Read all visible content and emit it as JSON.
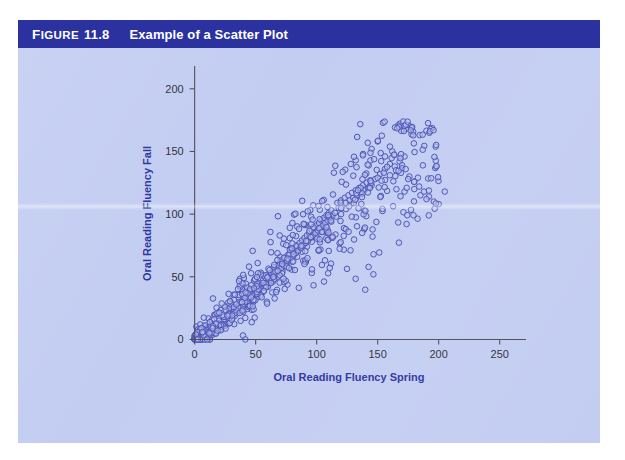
{
  "figure": {
    "label_word": "Figure",
    "label_word_first": "F",
    "label_word_rest": "IGURE",
    "number": "11.8",
    "title": "Example of a Scatter Plot"
  },
  "colors": {
    "header_bar": "#2b32a0",
    "panel_background": "#c3cdf2",
    "axis_title": "#2b32a0",
    "point_stroke": "#4a52b8",
    "point_fill": "#b9c2ea",
    "axis_line": "#4d4d57",
    "tick_label": "#2e2e38",
    "page_background": "#ffffff"
  },
  "chart_data": {
    "type": "scatter",
    "title": "Example of a Scatter Plot",
    "xlabel": "Oral Reading Fluency Spring",
    "ylabel": "Oral Reading Fluency Fall",
    "xlim": [
      -12,
      265
    ],
    "ylim": [
      -14,
      215
    ],
    "xticks": [
      0,
      50,
      100,
      150,
      200,
      250
    ],
    "yticks": [
      0,
      50,
      100,
      150,
      200
    ],
    "xtick_labels": [
      "0",
      "50",
      "100",
      "150",
      "200",
      "250"
    ],
    "ytick_labels": [
      "0",
      "50",
      "100",
      "150",
      "200"
    ],
    "grid": false,
    "legend": null,
    "marker": "open-circle",
    "n_points": 760,
    "correlation_approx": 0.88,
    "x_range_observed": [
      0,
      205
    ],
    "y_range_observed": [
      0,
      172
    ],
    "points": [
      [
        2,
        0
      ],
      [
        4,
        1
      ],
      [
        5,
        0
      ],
      [
        7,
        2
      ],
      [
        6,
        3
      ],
      [
        9,
        1
      ],
      [
        8,
        4
      ],
      [
        11,
        2
      ],
      [
        10,
        5
      ],
      [
        13,
        3
      ],
      [
        12,
        6
      ],
      [
        15,
        4
      ],
      [
        14,
        8
      ],
      [
        17,
        5
      ],
      [
        16,
        9
      ],
      [
        19,
        7
      ],
      [
        18,
        11
      ],
      [
        21,
        8
      ],
      [
        20,
        13
      ],
      [
        23,
        10
      ],
      [
        22,
        14
      ],
      [
        25,
        11
      ],
      [
        24,
        16
      ],
      [
        27,
        13
      ],
      [
        26,
        18
      ],
      [
        29,
        15
      ],
      [
        28,
        20
      ],
      [
        31,
        17
      ],
      [
        30,
        22
      ],
      [
        33,
        19
      ],
      [
        3,
        2
      ],
      [
        5,
        4
      ],
      [
        8,
        6
      ],
      [
        12,
        9
      ],
      [
        16,
        12
      ],
      [
        20,
        15
      ],
      [
        24,
        18
      ],
      [
        28,
        21
      ],
      [
        32,
        24
      ],
      [
        36,
        27
      ],
      [
        35,
        21
      ],
      [
        34,
        25
      ],
      [
        37,
        23
      ],
      [
        39,
        26
      ],
      [
        38,
        29
      ],
      [
        41,
        27
      ],
      [
        40,
        31
      ],
      [
        43,
        29
      ],
      [
        42,
        33
      ],
      [
        45,
        31
      ],
      [
        44,
        35
      ],
      [
        47,
        33
      ],
      [
        46,
        37
      ],
      [
        49,
        35
      ],
      [
        48,
        39
      ],
      [
        51,
        37
      ],
      [
        50,
        41
      ],
      [
        53,
        39
      ],
      [
        52,
        43
      ],
      [
        55,
        41
      ],
      [
        40,
        22
      ],
      [
        44,
        26
      ],
      [
        48,
        30
      ],
      [
        52,
        34
      ],
      [
        56,
        38
      ],
      [
        60,
        42
      ],
      [
        64,
        46
      ],
      [
        68,
        50
      ],
      [
        72,
        54
      ],
      [
        76,
        58
      ],
      [
        54,
        45
      ],
      [
        57,
        43
      ],
      [
        56,
        47
      ],
      [
        59,
        45
      ],
      [
        58,
        49
      ],
      [
        61,
        47
      ],
      [
        60,
        51
      ],
      [
        63,
        49
      ],
      [
        62,
        53
      ],
      [
        65,
        51
      ],
      [
        64,
        55
      ],
      [
        67,
        53
      ],
      [
        66,
        57
      ],
      [
        69,
        55
      ],
      [
        68,
        59
      ],
      [
        71,
        57
      ],
      [
        70,
        61
      ],
      [
        73,
        59
      ],
      [
        72,
        63
      ],
      [
        75,
        61
      ],
      [
        80,
        62
      ],
      [
        84,
        66
      ],
      [
        88,
        70
      ],
      [
        92,
        74
      ],
      [
        96,
        78
      ],
      [
        100,
        82
      ],
      [
        104,
        86
      ],
      [
        108,
        90
      ],
      [
        112,
        94
      ],
      [
        116,
        98
      ],
      [
        74,
        65
      ],
      [
        77,
        63
      ],
      [
        76,
        67
      ],
      [
        79,
        65
      ],
      [
        78,
        69
      ],
      [
        81,
        67
      ],
      [
        80,
        71
      ],
      [
        83,
        69
      ],
      [
        82,
        73
      ],
      [
        85,
        71
      ],
      [
        84,
        75
      ],
      [
        87,
        73
      ],
      [
        86,
        77
      ],
      [
        89,
        75
      ],
      [
        88,
        79
      ],
      [
        91,
        77
      ],
      [
        90,
        81
      ],
      [
        93,
        79
      ],
      [
        92,
        83
      ],
      [
        95,
        81
      ],
      [
        120,
        100
      ],
      [
        124,
        104
      ],
      [
        128,
        108
      ],
      [
        132,
        112
      ],
      [
        136,
        116
      ],
      [
        140,
        120
      ],
      [
        144,
        124
      ],
      [
        148,
        128
      ],
      [
        152,
        132
      ],
      [
        156,
        136
      ],
      [
        94,
        85
      ],
      [
        97,
        83
      ],
      [
        96,
        87
      ],
      [
        99,
        85
      ],
      [
        98,
        89
      ],
      [
        101,
        87
      ],
      [
        100,
        91
      ],
      [
        103,
        89
      ],
      [
        102,
        93
      ],
      [
        105,
        91
      ],
      [
        104,
        95
      ],
      [
        107,
        93
      ],
      [
        106,
        97
      ],
      [
        109,
        95
      ],
      [
        108,
        99
      ],
      [
        111,
        97
      ],
      [
        110,
        101
      ],
      [
        113,
        99
      ],
      [
        112,
        103
      ],
      [
        115,
        101
      ],
      [
        160,
        140
      ],
      [
        164,
        138
      ],
      [
        168,
        142
      ],
      [
        172,
        146
      ],
      [
        176,
        130
      ],
      [
        180,
        126
      ],
      [
        184,
        122
      ],
      [
        188,
        118
      ],
      [
        192,
        114
      ],
      [
        196,
        110
      ],
      [
        118,
        105
      ],
      [
        117,
        109
      ],
      [
        121,
        107
      ],
      [
        120,
        111
      ],
      [
        124,
        109
      ],
      [
        123,
        113
      ],
      [
        127,
        111
      ],
      [
        126,
        115
      ],
      [
        130,
        113
      ],
      [
        129,
        117
      ],
      [
        133,
        115
      ],
      [
        132,
        119
      ],
      [
        136,
        117
      ],
      [
        135,
        121
      ],
      [
        139,
        119
      ],
      [
        138,
        123
      ],
      [
        142,
        121
      ],
      [
        141,
        125
      ],
      [
        145,
        123
      ],
      [
        144,
        127
      ],
      [
        150,
        129
      ],
      [
        155,
        133
      ],
      [
        160,
        131
      ],
      [
        165,
        135
      ],
      [
        170,
        139
      ],
      [
        175,
        128
      ],
      [
        180,
        120
      ],
      [
        185,
        115
      ],
      [
        190,
        112
      ],
      [
        200,
        108
      ],
      [
        168,
        172
      ],
      [
        150,
        158
      ],
      [
        145,
        152
      ],
      [
        138,
        148
      ],
      [
        162,
        150
      ],
      [
        156,
        146
      ],
      [
        132,
        143
      ],
      [
        128,
        140
      ],
      [
        172,
        118
      ],
      [
        205,
        118
      ]
    ]
  }
}
